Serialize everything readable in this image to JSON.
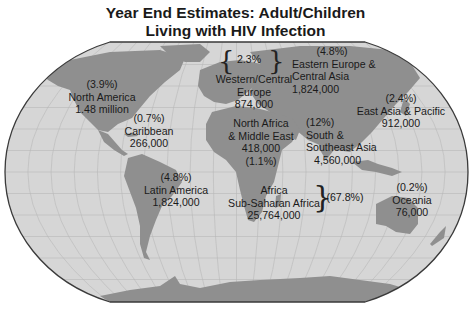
{
  "title": {
    "line1": "Year End Estimates: Adult/Children",
    "line2": "Living with HIV Infection"
  },
  "colors": {
    "ocean": "#d6d6d6",
    "land": "#8f8f8f",
    "grid": "#b9b9b9",
    "outline": "#3a3a3a"
  },
  "regions": [
    {
      "id": "north-america",
      "pct": "(3.9%)",
      "name": [
        "North America"
      ],
      "value": "1.48 million"
    },
    {
      "id": "caribbean",
      "pct": "(0.7%)",
      "name": [
        "Caribbean"
      ],
      "value": "266,000"
    },
    {
      "id": "latin-america",
      "pct": "(4.8%)",
      "name": [
        "Latin America"
      ],
      "value": "1,824,000"
    },
    {
      "id": "western-central-europe",
      "pct": "2.3%",
      "name": [
        "Western/Central",
        "Europe"
      ],
      "value": "874,000"
    },
    {
      "id": "eastern-europe-central-asia",
      "pct": "(4.8%)",
      "name": [
        "Eastern Europe &",
        "Central Asia"
      ],
      "value": "1,824,000"
    },
    {
      "id": "east-asia-pacific",
      "pct": "(2.4%)",
      "name": [
        "East Asia & Pacific"
      ],
      "value": "912,000"
    },
    {
      "id": "north-africa-middle-east",
      "pct": "(1.1%)",
      "name": [
        "North Africa",
        "& Middle East"
      ],
      "value": "418,000"
    },
    {
      "id": "south-southeast-asia",
      "pct": "(12%)",
      "name": [
        "South &",
        "Southeast Asia"
      ],
      "value": "4,560,000"
    },
    {
      "id": "sub-saharan-africa",
      "pct": "(67.8%)",
      "name": [
        "Africa",
        "Sub-Saharan Africa"
      ],
      "value": "25,764,000"
    },
    {
      "id": "oceania",
      "pct": "(0.2%)",
      "name": [
        "Oceania"
      ],
      "value": "76,000"
    }
  ]
}
